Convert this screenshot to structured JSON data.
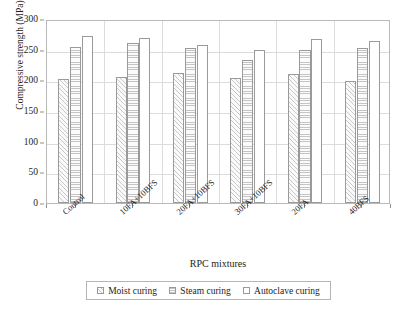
{
  "chart_data": {
    "type": "bar",
    "title": "",
    "xlabel": "RPC mixtures",
    "ylabel": "Compressive strength (MPa)",
    "ylim": [
      0,
      300
    ],
    "yticks": [
      0,
      50,
      100,
      150,
      200,
      250,
      300
    ],
    "ytick_labels": [
      "0",
      "50",
      "100",
      "150",
      "200",
      "250",
      "300"
    ],
    "grid": true,
    "legend_position": "bottom",
    "categories": [
      "Control",
      "10FA+10BFS",
      "20FA+10BFS",
      "30FA+10BFS",
      "20FA",
      "40BFS"
    ],
    "series": [
      {
        "name": "Moist curing",
        "values": [
          202,
          206,
          212,
          204,
          210,
          199
        ]
      },
      {
        "name": "Steam curing",
        "values": [
          254,
          261,
          252,
          233,
          249,
          252
        ]
      },
      {
        "name": "Autoclave curing",
        "values": [
          273,
          269,
          258,
          249,
          267,
          264
        ]
      }
    ]
  },
  "axes": {
    "y_title": "Compressive strength (MPa)",
    "x_title": "RPC mixtures"
  },
  "legend": {
    "items": [
      {
        "label": "Moist curing",
        "swatch": "moist"
      },
      {
        "label": "Steam curing",
        "swatch": "steam"
      },
      {
        "label": "Autoclave curing",
        "swatch": "autoclave"
      }
    ]
  }
}
